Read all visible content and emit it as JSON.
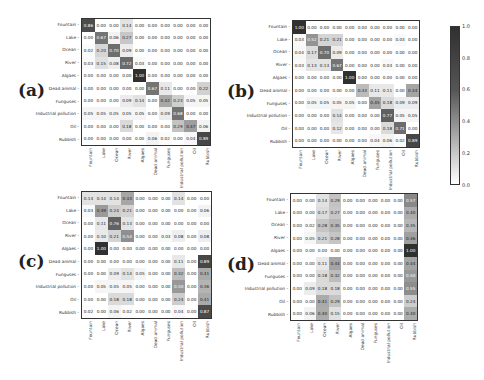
{
  "chart_data": [
    {
      "type": "heatmap",
      "panel": "(a)",
      "title": "",
      "xlabel": "",
      "ylabel": "",
      "row_labels": [
        "Fountain",
        "Lake",
        "Ocean",
        "River",
        "Algaes",
        "Dead animal",
        "Funguses",
        "Industrial pollution",
        "Oil",
        "Rubbish"
      ],
      "col_labels": [
        "Fountain",
        "Lake",
        "Ocean",
        "River",
        "Algaes",
        "Dead animal",
        "Funguses",
        "Industrial pollution",
        "Oil",
        "Rubbish"
      ],
      "values": [
        [
          0.86,
          0.0,
          0.0,
          0.14,
          0.0,
          0.0,
          0.0,
          0.0,
          0.0,
          0.0
        ],
        [
          0.0,
          0.67,
          0.06,
          0.27,
          0.0,
          0.0,
          0.0,
          0.0,
          0.0,
          0.0
        ],
        [
          0.02,
          0.2,
          0.7,
          0.09,
          0.0,
          0.0,
          0.0,
          0.0,
          0.0,
          0.0
        ],
        [
          0.03,
          0.15,
          0.08,
          0.72,
          0.03,
          0.0,
          0.0,
          0.0,
          0.0,
          0.0
        ],
        [
          0.0,
          0.0,
          0.0,
          0.0,
          1.0,
          0.0,
          0.0,
          0.0,
          0.0,
          0.0
        ],
        [
          0.0,
          0.0,
          0.0,
          0.0,
          0.0,
          0.67,
          0.11,
          0.0,
          0.0,
          0.22
        ],
        [
          0.0,
          0.0,
          0.0,
          0.09,
          0.14,
          0.0,
          0.42,
          0.23,
          0.05,
          0.05
        ],
        [
          0.05,
          0.05,
          0.05,
          0.05,
          0.05,
          0.0,
          0.09,
          0.68,
          0.0,
          0.0
        ],
        [
          0.0,
          0.0,
          0.0,
          0.18,
          0.0,
          0.0,
          0.0,
          0.29,
          0.47,
          0.06
        ],
        [
          0.0,
          0.0,
          0.0,
          0.0,
          0.0,
          0.06,
          0.02,
          0.0,
          0.04,
          0.89
        ]
      ]
    },
    {
      "type": "heatmap",
      "panel": "(b)",
      "title": "",
      "xlabel": "",
      "ylabel": "",
      "row_labels": [
        "Fountain",
        "Lake",
        "Ocean",
        "River",
        "Algaes",
        "Dead animal",
        "Funguses",
        "Industrial pollution",
        "Oil",
        "Rubbish"
      ],
      "col_labels": [
        "Fountain",
        "Lake",
        "Ocean",
        "River",
        "Algaes",
        "Dead animal",
        "Funguses",
        "Industrial pollution",
        "Oil",
        "Rubbish"
      ],
      "values": [
        [
          1.0,
          0.0,
          0.0,
          0.0,
          0.0,
          0.0,
          0.0,
          0.0,
          0.0,
          0.0
        ],
        [
          0.03,
          0.52,
          0.21,
          0.21,
          0.0,
          0.0,
          0.0,
          0.0,
          0.03,
          0.0
        ],
        [
          0.04,
          0.17,
          0.7,
          0.09,
          0.0,
          0.0,
          0.0,
          0.0,
          0.0,
          0.0
        ],
        [
          0.03,
          0.13,
          0.13,
          0.67,
          0.0,
          0.0,
          0.0,
          0.03,
          0.0,
          0.0
        ],
        [
          0.0,
          0.0,
          0.0,
          0.0,
          1.0,
          0.0,
          0.0,
          0.0,
          0.0,
          0.0
        ],
        [
          0.0,
          0.0,
          0.0,
          0.0,
          0.0,
          0.33,
          0.11,
          0.11,
          0.0,
          0.44
        ],
        [
          0.0,
          0.05,
          0.05,
          0.05,
          0.05,
          0.0,
          0.45,
          0.18,
          0.09,
          0.09
        ],
        [
          0.0,
          0.0,
          0.0,
          0.14,
          0.0,
          0.0,
          0.0,
          0.77,
          0.05,
          0.05
        ],
        [
          0.0,
          0.0,
          0.0,
          0.12,
          0.0,
          0.0,
          0.0,
          0.18,
          0.71,
          0.0
        ],
        [
          0.0,
          0.0,
          0.0,
          0.0,
          0.0,
          0.0,
          0.04,
          0.06,
          0.02,
          0.89
        ]
      ]
    },
    {
      "type": "heatmap",
      "panel": "(c)",
      "title": "",
      "xlabel": "",
      "ylabel": "",
      "row_labels": [
        "Fountain",
        "Lake",
        "Ocean",
        "River",
        "Algaes",
        "Dead animal",
        "Funguses",
        "Industrial pollution",
        "Oil",
        "Rubbish"
      ],
      "col_labels": [
        "Fountain",
        "Lake",
        "Ocean",
        "River",
        "Algaes",
        "Dead animal",
        "Funguses",
        "Industrial pollution",
        "Oil",
        "Rubbish"
      ],
      "values": [
        [
          0.14,
          0.14,
          0.14,
          0.43,
          0.0,
          0.0,
          0.0,
          0.14,
          0.0,
          0.0
        ],
        [
          0.03,
          0.49,
          0.24,
          0.21,
          0.0,
          0.0,
          0.0,
          0.0,
          0.0,
          0.06
        ],
        [
          0.0,
          0.11,
          0.76,
          0.13,
          0.0,
          0.0,
          0.0,
          0.0,
          0.0,
          0.0
        ],
        [
          0.0,
          0.1,
          0.21,
          0.54,
          0.0,
          0.0,
          0.03,
          0.08,
          0.0,
          0.08
        ],
        [
          0.0,
          1.0,
          0.0,
          0.0,
          0.0,
          0.0,
          0.0,
          0.0,
          0.0,
          0.0
        ],
        [
          0.0,
          0.0,
          0.0,
          0.0,
          0.0,
          0.0,
          0.0,
          0.11,
          0.0,
          0.89
        ],
        [
          0.0,
          0.0,
          0.09,
          0.14,
          0.05,
          0.0,
          0.0,
          0.32,
          0.0,
          0.41
        ],
        [
          0.0,
          0.05,
          0.05,
          0.05,
          0.0,
          0.0,
          0.0,
          0.5,
          0.0,
          0.36
        ],
        [
          0.0,
          0.0,
          0.18,
          0.18,
          0.0,
          0.0,
          0.0,
          0.24,
          0.0,
          0.41
        ],
        [
          0.02,
          0.0,
          0.06,
          0.02,
          0.0,
          0.0,
          0.0,
          0.04,
          0.0,
          0.87
        ]
      ]
    },
    {
      "type": "heatmap",
      "panel": "(d)",
      "title": "",
      "xlabel": "",
      "ylabel": "",
      "row_labels": [
        "Fountain",
        "Lake",
        "Ocean",
        "River",
        "Algaes",
        "Dead animal",
        "Funguses",
        "Industrial pollution",
        "Oil",
        "Rubbish"
      ],
      "col_labels": [
        "Fountain",
        "Lake",
        "Ocean",
        "River",
        "Algaes",
        "Dead animal",
        "Funguses",
        "Industrial pollution",
        "Oil",
        "Rubbish"
      ],
      "values": [
        [
          0.0,
          0.0,
          0.14,
          0.29,
          0.0,
          0.0,
          0.0,
          0.0,
          0.0,
          0.57
        ],
        [
          0.0,
          0.0,
          0.17,
          0.27,
          0.0,
          0.0,
          0.0,
          0.0,
          0.0,
          0.4
        ],
        [
          0.0,
          0.02,
          0.28,
          0.35,
          0.0,
          0.0,
          0.0,
          0.0,
          0.0,
          0.35
        ],
        [
          0.0,
          0.05,
          0.21,
          0.28,
          0.0,
          0.0,
          0.0,
          0.0,
          0.0,
          0.46
        ],
        [
          0.0,
          0.0,
          0.0,
          0.0,
          0.0,
          0.0,
          0.0,
          0.0,
          0.0,
          1.0
        ],
        [
          0.0,
          0.0,
          0.11,
          0.44,
          0.0,
          0.0,
          0.0,
          0.0,
          0.0,
          0.44
        ],
        [
          0.0,
          0.0,
          0.18,
          0.32,
          0.0,
          0.0,
          0.0,
          0.0,
          0.0,
          0.5
        ],
        [
          0.0,
          0.09,
          0.18,
          0.18,
          0.0,
          0.0,
          0.0,
          0.0,
          0.0,
          0.55
        ],
        [
          0.0,
          0.0,
          0.41,
          0.29,
          0.0,
          0.0,
          0.0,
          0.0,
          0.0,
          0.24
        ],
        [
          0.0,
          0.06,
          0.4,
          0.15,
          0.0,
          0.0,
          0.0,
          0.0,
          0.0,
          0.4
        ]
      ]
    }
  ],
  "colorbar": {
    "ticks": [
      "1.0",
      "0.8",
      "0.6",
      "0.4",
      "0.2",
      "0.0"
    ],
    "range": [
      0.0,
      1.0
    ]
  },
  "panels": [
    {
      "label": "(a)",
      "labelX": 18,
      "labelY": 80,
      "x": 81,
      "y": 18,
      "w": 130,
      "h": 128
    },
    {
      "label": "(b)",
      "labelX": 227,
      "labelY": 81,
      "x": 292,
      "y": 20,
      "w": 128,
      "h": 128
    },
    {
      "label": "(c)",
      "labelX": 18,
      "labelY": 251,
      "x": 81,
      "y": 191,
      "w": 131,
      "h": 128
    },
    {
      "label": "(d)",
      "labelX": 227,
      "labelY": 254,
      "x": 290,
      "y": 193,
      "w": 128,
      "h": 128
    }
  ]
}
